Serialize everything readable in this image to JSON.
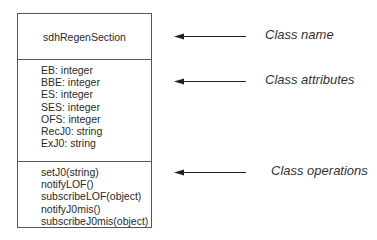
{
  "uml_class": {
    "name": "sdhRegenSection",
    "attributes": [
      "EB: integer",
      "BBE: integer",
      "ES: integer",
      "SES: integer",
      "OFS: integer",
      "RecJ0: string",
      "ExJ0: string"
    ],
    "operations": [
      "setJ0(string)",
      "notifyLOF()",
      "subscribeLOF(object)",
      "notifyJ0mis()",
      "subscribeJ0mis(object)"
    ]
  },
  "annotations": [
    {
      "label": "Class name",
      "arrow_icon": "left-arrow"
    },
    {
      "label": "Class attributes",
      "arrow_icon": "left-arrow"
    },
    {
      "label": "Class operations",
      "arrow_icon": "left-arrow"
    }
  ],
  "colors": {
    "line": "#555555",
    "text": "#2a2a2a",
    "arrow": "#222222"
  }
}
